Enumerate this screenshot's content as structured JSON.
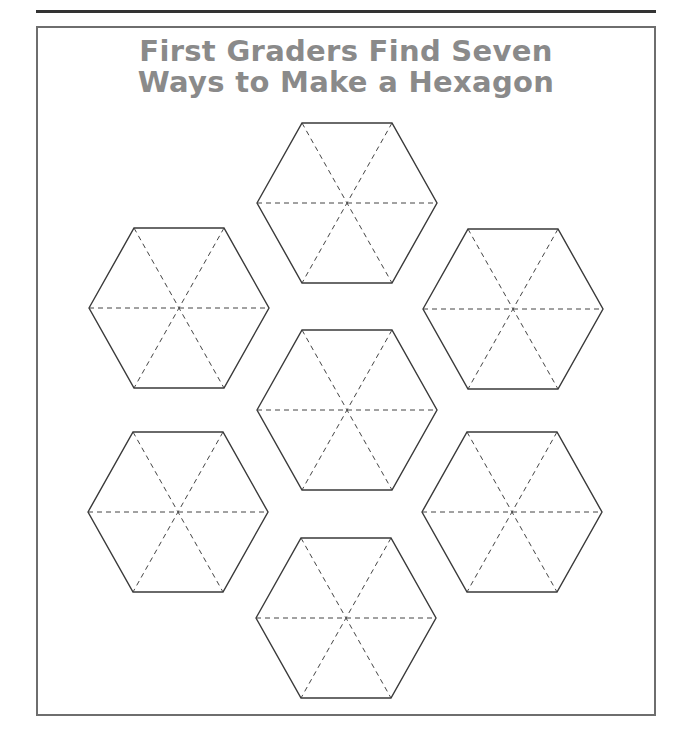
{
  "title": {
    "line1": "First Graders Find Seven",
    "line2": "Ways to Make a Hexagon"
  },
  "colors": {
    "title": "#8a8a8a",
    "outline": "#3a3a3a",
    "dashed": "#444444",
    "frame": "#6e6e6e",
    "rule": "#333333"
  },
  "hexagons": [
    {
      "name": "hexagon-top",
      "cx": 347,
      "cy": 203
    },
    {
      "name": "hexagon-upper-left",
      "cx": 179,
      "cy": 308
    },
    {
      "name": "hexagon-upper-right",
      "cx": 513,
      "cy": 309
    },
    {
      "name": "hexagon-center",
      "cx": 347,
      "cy": 410
    },
    {
      "name": "hexagon-lower-left",
      "cx": 178,
      "cy": 512
    },
    {
      "name": "hexagon-lower-right",
      "cx": 512,
      "cy": 512
    },
    {
      "name": "hexagon-bottom",
      "cx": 346,
      "cy": 618
    }
  ],
  "hexagon_geometry": {
    "radius": 90,
    "half_height": 80,
    "half_top": 45
  }
}
